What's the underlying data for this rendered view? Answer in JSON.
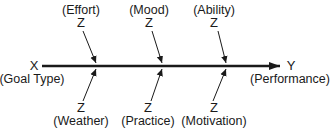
{
  "diagram": {
    "type": "moderation-path-diagram",
    "source": {
      "symbol": "X",
      "label": "(Goal Type)"
    },
    "target": {
      "symbol": "Y",
      "label": "(Performance)"
    },
    "moderators_top": [
      {
        "symbol": "Z",
        "label": "(Effort)"
      },
      {
        "symbol": "Z",
        "label": "(Mood)"
      },
      {
        "symbol": "Z",
        "label": "(Ability)"
      }
    ],
    "moderators_bottom": [
      {
        "symbol": "Z",
        "label": "(Weather)"
      },
      {
        "symbol": "Z",
        "label": "(Practice)"
      },
      {
        "symbol": "Z",
        "label": "(Motivation)"
      }
    ],
    "colors": {
      "line": "#1a1a1a",
      "background": "#ffffff"
    }
  }
}
